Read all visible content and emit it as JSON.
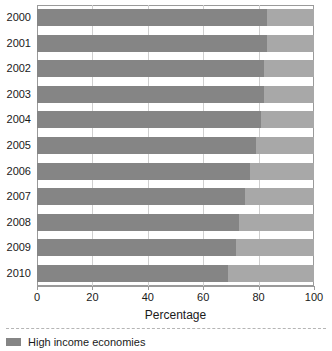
{
  "chart_data": {
    "type": "bar",
    "orientation": "horizontal",
    "stacked": true,
    "title": "",
    "xlabel": "Percentage",
    "ylabel": "",
    "xlim": [
      0,
      100
    ],
    "xticks": [
      0,
      20,
      40,
      60,
      80,
      100
    ],
    "xtick_labels": [
      "0",
      "20",
      "40",
      "60",
      "80",
      "100"
    ],
    "grid": true,
    "grid_axis": "x",
    "legend_position": "bottom-left",
    "categories": [
      "2000",
      "2001",
      "2002",
      "2003",
      "2004",
      "2005",
      "2006",
      "2007",
      "2008",
      "2009",
      "2010"
    ],
    "series": [
      {
        "name": "High income economies",
        "color": "#858585",
        "values": [
          83,
          83,
          82,
          82,
          81,
          79,
          77,
          75,
          73,
          72,
          69
        ]
      },
      {
        "name": "",
        "color": "#a8a8a8",
        "values": [
          17,
          17,
          18,
          18,
          19,
          21,
          23,
          25,
          27,
          28,
          31
        ]
      }
    ]
  },
  "axes": {
    "x_title": "Percentage",
    "x_tick_labels": [
      "0",
      "20",
      "40",
      "60",
      "80",
      "100"
    ],
    "y_tick_labels": [
      "2000",
      "2001",
      "2002",
      "2003",
      "2004",
      "2005",
      "2006",
      "2007",
      "2008",
      "2009",
      "2010"
    ]
  },
  "legend": {
    "entries": [
      {
        "label": "High income economies",
        "color": "#858585"
      }
    ]
  },
  "colors": {
    "primary_series": "#858585",
    "secondary_series": "#a8a8a8",
    "plot_background": "#ffffff",
    "axis_line": "#9a9a9a",
    "gridline": "#cfcfcf",
    "text": "#1a1a1a"
  }
}
